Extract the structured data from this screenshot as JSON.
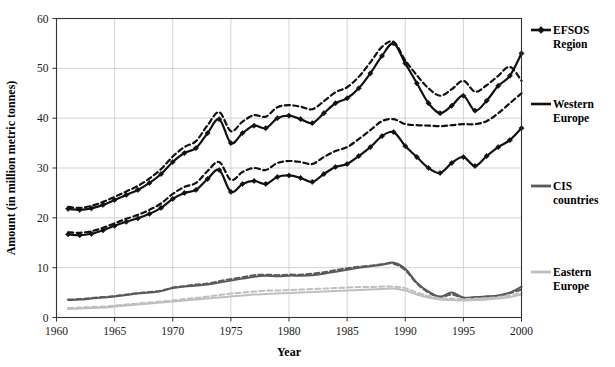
{
  "chart_data": {
    "type": "line",
    "title": "",
    "xlabel": "Year",
    "ylabel": "Amount (in million metric tonnes)",
    "xlim": [
      1960,
      2000
    ],
    "ylim": [
      0,
      60
    ],
    "xticks": [
      1960,
      1965,
      1970,
      1975,
      1980,
      1985,
      1990,
      1995,
      2000
    ],
    "yticks": [
      0,
      10,
      20,
      30,
      40,
      50,
      60
    ],
    "grid": true,
    "legend_position": "right",
    "x": [
      1961,
      1962,
      1963,
      1964,
      1965,
      1966,
      1967,
      1968,
      1969,
      1970,
      1971,
      1972,
      1973,
      1974,
      1975,
      1976,
      1977,
      1978,
      1979,
      1980,
      1981,
      1982,
      1983,
      1984,
      1985,
      1986,
      1987,
      1988,
      1989,
      1990,
      1991,
      1992,
      1993,
      1994,
      1995,
      1996,
      1997,
      1998,
      1999,
      2000
    ],
    "series": [
      {
        "name": "EFSOS Region",
        "color": "#111111",
        "style": "solid",
        "marker": "diamond",
        "values": [
          21.8,
          21.6,
          21.9,
          22.6,
          23.6,
          24.6,
          25.6,
          27.0,
          28.8,
          31.2,
          33.0,
          34.0,
          37.0,
          39.8,
          35.0,
          37.0,
          38.5,
          38.0,
          40.0,
          40.5,
          39.8,
          39.0,
          41.0,
          43.0,
          44.0,
          46.0,
          49.0,
          52.5,
          55.0,
          51.0,
          47.0,
          43.0,
          41.0,
          42.5,
          44.5,
          41.5,
          43.5,
          46.5,
          48.5,
          53.0
        ]
      },
      {
        "name": "EFSOS Region (projection)",
        "color": "#111111",
        "style": "dashed",
        "marker": "none",
        "values": [
          22.2,
          22.0,
          22.4,
          23.2,
          24.2,
          25.3,
          26.4,
          27.9,
          29.8,
          32.3,
          34.2,
          35.4,
          38.6,
          41.2,
          37.4,
          39.3,
          40.6,
          40.3,
          42.2,
          42.6,
          42.3,
          41.8,
          43.4,
          45.2,
          46.2,
          48.3,
          51.2,
          54.3,
          55.3,
          51.6,
          48.6,
          46.0,
          44.5,
          45.8,
          47.5,
          45.3,
          46.6,
          48.5,
          50.3,
          47.5
        ]
      },
      {
        "name": "Western Europe",
        "color": "#111111",
        "style": "solid",
        "marker": "diamond",
        "values": [
          16.7,
          16.5,
          16.8,
          17.5,
          18.4,
          19.2,
          19.9,
          20.8,
          22.0,
          23.8,
          25.0,
          25.6,
          27.8,
          29.6,
          25.2,
          26.8,
          27.4,
          26.8,
          28.2,
          28.5,
          28.0,
          27.2,
          28.8,
          30.2,
          30.8,
          32.4,
          34.2,
          36.4,
          37.2,
          34.4,
          32.2,
          30.0,
          29.0,
          31.0,
          32.2,
          30.4,
          32.4,
          34.2,
          35.6,
          38.0
        ]
      },
      {
        "name": "Western Europe (projection)",
        "color": "#111111",
        "style": "dashed",
        "marker": "none",
        "values": [
          17.1,
          17.0,
          17.3,
          18.0,
          18.9,
          19.8,
          20.6,
          21.6,
          22.9,
          24.8,
          26.2,
          27.0,
          29.4,
          31.2,
          27.6,
          29.2,
          30.0,
          29.6,
          31.0,
          31.4,
          31.2,
          30.8,
          32.2,
          33.4,
          34.2,
          35.8,
          37.6,
          39.4,
          39.8,
          38.8,
          38.6,
          38.5,
          38.4,
          38.6,
          38.8,
          38.8,
          39.4,
          41.0,
          43.0,
          45.0
        ]
      },
      {
        "name": "CIS countries",
        "color": "#5a5a5a",
        "style": "solid",
        "marker": "none",
        "values": [
          3.5,
          3.6,
          3.8,
          4.0,
          4.2,
          4.5,
          4.8,
          5.0,
          5.3,
          5.9,
          6.2,
          6.4,
          6.6,
          7.0,
          7.4,
          7.8,
          8.2,
          8.4,
          8.3,
          8.4,
          8.4,
          8.5,
          8.8,
          9.2,
          9.6,
          10.0,
          10.3,
          10.6,
          11.0,
          9.8,
          7.0,
          5.2,
          4.2,
          5.0,
          4.0,
          4.1,
          4.2,
          4.4,
          5.0,
          6.2
        ]
      },
      {
        "name": "CIS countries (projection)",
        "color": "#5a5a5a",
        "style": "dashed",
        "marker": "none",
        "values": [
          3.6,
          3.7,
          3.9,
          4.1,
          4.3,
          4.6,
          4.9,
          5.1,
          5.4,
          6.0,
          6.3,
          6.6,
          6.8,
          7.3,
          7.7,
          8.1,
          8.5,
          8.6,
          8.5,
          8.6,
          8.6,
          8.8,
          9.1,
          9.5,
          9.9,
          10.2,
          10.4,
          10.7,
          10.8,
          9.5,
          6.8,
          5.0,
          4.1,
          4.6,
          3.9,
          4.0,
          4.2,
          4.4,
          4.9,
          5.6
        ]
      },
      {
        "name": "Eastern Europe",
        "color": "#bfbfbf",
        "style": "solid",
        "marker": "none",
        "values": [
          1.7,
          1.8,
          1.9,
          2.0,
          2.2,
          2.4,
          2.6,
          2.8,
          3.0,
          3.2,
          3.4,
          3.6,
          3.8,
          4.0,
          4.2,
          4.4,
          4.6,
          4.7,
          4.8,
          4.9,
          5.0,
          5.1,
          5.2,
          5.3,
          5.4,
          5.5,
          5.6,
          5.7,
          5.8,
          5.4,
          4.6,
          4.0,
          3.6,
          3.5,
          3.4,
          3.5,
          3.6,
          3.8,
          4.1,
          4.6
        ]
      },
      {
        "name": "Eastern Europe (projection)",
        "color": "#bfbfbf",
        "style": "dashed",
        "marker": "none",
        "values": [
          1.9,
          2.0,
          2.1,
          2.2,
          2.4,
          2.6,
          2.8,
          3.0,
          3.2,
          3.4,
          3.7,
          3.9,
          4.2,
          4.5,
          4.8,
          5.0,
          5.2,
          5.4,
          5.4,
          5.5,
          5.6,
          5.7,
          5.8,
          5.9,
          6.0,
          6.1,
          6.1,
          6.2,
          6.2,
          5.9,
          5.0,
          4.3,
          3.9,
          3.8,
          3.7,
          3.8,
          3.9,
          4.1,
          4.4,
          4.9
        ]
      }
    ]
  },
  "legend": {
    "entries": [
      {
        "label_line1": "EFSOS",
        "label_line2": "Region",
        "color": "#111111",
        "marker": "diamond"
      },
      {
        "label_line1": "Western",
        "label_line2": "Europe",
        "color": "#111111",
        "marker": "none"
      },
      {
        "label_line1": "CIS",
        "label_line2": "countries",
        "color": "#5a5a5a",
        "marker": "none"
      },
      {
        "label_line1": "Eastern",
        "label_line2": "Europe",
        "color": "#bfbfbf",
        "marker": "none"
      }
    ]
  }
}
